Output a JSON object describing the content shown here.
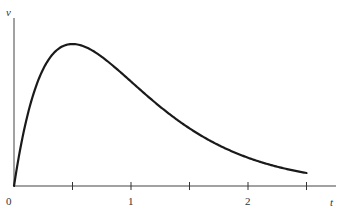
{
  "chart_data": {
    "type": "line",
    "title": "",
    "xlabel": "t",
    "ylabel": "v",
    "xlim": [
      0,
      2.85
    ],
    "ylim": [
      0,
      1.08
    ],
    "grid": false,
    "legend": "none",
    "x_ticks": [
      0,
      0.5,
      1,
      1.5,
      2,
      2.5
    ],
    "x_tick_labels": [
      "0",
      "",
      "1",
      "",
      "2",
      ""
    ],
    "y_ticks": [],
    "series": [
      {
        "name": "v(t)",
        "formula": "v proportional to t*exp(-2t), normalized to peak 1 at t=0.5",
        "x": [
          0,
          0.05,
          0.1,
          0.15,
          0.2,
          0.25,
          0.3,
          0.35,
          0.4,
          0.45,
          0.5,
          0.55,
          0.6,
          0.7,
          0.8,
          0.9,
          1.0,
          1.1,
          1.2,
          1.3,
          1.4,
          1.5,
          1.6,
          1.7,
          1.8,
          1.9,
          2.0,
          2.1,
          2.2,
          2.3,
          2.4,
          2.5
        ],
        "y": [
          0,
          0.246,
          0.445,
          0.602,
          0.722,
          0.824,
          0.892,
          0.944,
          0.978,
          0.995,
          1.0,
          0.995,
          0.978,
          0.921,
          0.862,
          0.73,
          0.736,
          0.607,
          0.55,
          0.48,
          0.416,
          0.369,
          0.302,
          0.256,
          0.215,
          0.178,
          0.199,
          0.122,
          0.1,
          0.081,
          0.066,
          0.091
        ]
      }
    ]
  }
}
